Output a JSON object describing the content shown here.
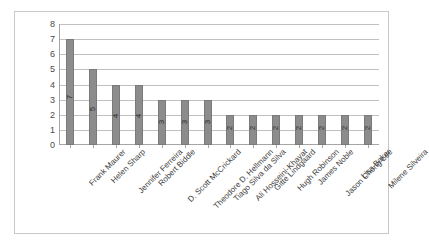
{
  "chart_data": {
    "type": "bar",
    "title": "",
    "subtitle": "",
    "xlabel": "",
    "ylabel": "",
    "ylim": [
      0,
      8
    ],
    "yticks": [
      0,
      1,
      2,
      3,
      4,
      5,
      6,
      7,
      8
    ],
    "grid": true,
    "legend": false,
    "orientation": "vertical",
    "bar_color": "#8c8c8c",
    "bar_border_color": "#7a7a7a",
    "gridline_color": "#c0c0c0",
    "axis_color": "#a6a6a6",
    "frame_color": "#c8c8c8",
    "label_rotation_deg": -45,
    "value_label_rotation_deg": -90,
    "categories": [
      "Frank Maurer",
      "Helen Sharp",
      "Jennifer Ferreira",
      "Robert Biddle",
      "D. Scott McCrickard",
      "Theodore D. Hellmann",
      "Tiago Silva da Silva",
      "Ali Hosseini-Khayat",
      "Gitte Lindgaard",
      "Hugh Robinson",
      "James Noble",
      "Jason Chong Lee",
      "Lisa Baker",
      "Milene Silveira"
    ],
    "values": [
      7,
      5,
      4,
      4,
      3,
      3,
      3,
      2,
      2,
      2,
      2,
      2,
      2,
      2
    ]
  }
}
